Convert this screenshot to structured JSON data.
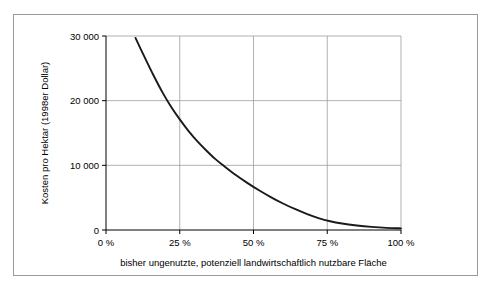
{
  "figure": {
    "frame_border_color": "#9a9a9a",
    "background": "#ffffff",
    "caption_fragment": ""
  },
  "chart_data": {
    "type": "line",
    "title": "",
    "xlabel": "bisher ungenutzte, potenziell landwirtschaftlich nutzbare Fläche",
    "ylabel": "Kosten pro Hektar (1998er Dollar)",
    "xlim": [
      0,
      100
    ],
    "ylim": [
      0,
      30000
    ],
    "grid": true,
    "legend": "none",
    "xticks": [
      0,
      25,
      50,
      75,
      100
    ],
    "xticklabels": [
      "0 %",
      "25 %",
      "50 %",
      "75 %",
      "100 %"
    ],
    "yticks": [
      0,
      10000,
      20000,
      30000
    ],
    "yticklabels": [
      "0",
      "10 000",
      "20 000",
      "30 000"
    ],
    "series": [
      {
        "name": "Kosten pro Hektar",
        "color": "#1a1a1a",
        "x": [
          10,
          13,
          16,
          19,
          22,
          25,
          28,
          31,
          34,
          37,
          40,
          44,
          48,
          52,
          56,
          60,
          64,
          68,
          72,
          76,
          80,
          85,
          90,
          95,
          100
        ],
        "values": [
          29700,
          26800,
          24000,
          21400,
          19100,
          17100,
          15300,
          13700,
          12300,
          11000,
          9900,
          8500,
          7250,
          6100,
          5050,
          4100,
          3250,
          2500,
          1850,
          1350,
          1000,
          700,
          480,
          330,
          250
        ]
      }
    ]
  },
  "axes": {
    "x_axis_name": "x-axis",
    "y_axis_name": "y-axis"
  }
}
